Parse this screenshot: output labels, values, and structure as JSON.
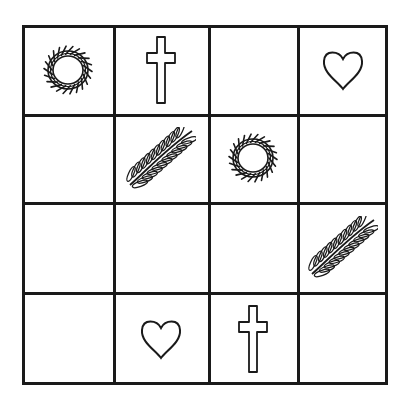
{
  "puzzle": {
    "type": "4x4 symbol grid",
    "rows": 4,
    "cols": 4,
    "symbols": {
      "crown": "crown-of-thorns-icon",
      "cross": "cross-icon",
      "heart": "heart-icon",
      "palm": "palm-branch-icon",
      "empty": ""
    },
    "cells": [
      [
        "crown",
        "cross",
        "empty",
        "heart"
      ],
      [
        "empty",
        "palm",
        "crown",
        "empty"
      ],
      [
        "empty",
        "empty",
        "empty",
        "palm"
      ],
      [
        "empty",
        "heart",
        "cross",
        "empty"
      ]
    ]
  },
  "colors": {
    "line": "#1a1a1a",
    "background": "#ffffff"
  }
}
